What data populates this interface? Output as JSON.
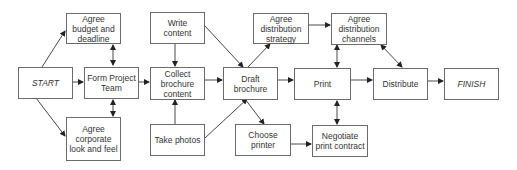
{
  "diagram": {
    "type": "flowchart",
    "nodes": {
      "start": "START",
      "budget": "Agree budget and deadline",
      "corporate": "Agree corporate look and feel",
      "team": "Form Project Team",
      "write": "Write content",
      "collect": "Collect brochure content",
      "photos": "Take photos",
      "draft": "Draft brochure",
      "strategy": "Agree distribution strategy",
      "printer": "Choose printer",
      "print": "Print",
      "channels": "Agree distribution channels",
      "contract": "Negotiate print contract",
      "distribute": "Distribute",
      "finish": "FINISH"
    },
    "edges": [
      {
        "from": "START",
        "to": "Agree budget and deadline"
      },
      {
        "from": "START",
        "to": "Form Project Team"
      },
      {
        "from": "START",
        "to": "Agree corporate look and feel"
      },
      {
        "from": "Agree budget and deadline",
        "to": "Form Project Team",
        "bidirectional": true
      },
      {
        "from": "Agree corporate look and feel",
        "to": "Form Project Team",
        "bidirectional": true
      },
      {
        "from": "Form Project Team",
        "to": "Collect brochure content"
      },
      {
        "from": "Write content",
        "to": "Collect brochure content"
      },
      {
        "from": "Take photos",
        "to": "Collect brochure content"
      },
      {
        "from": "Write content",
        "to": "Draft brochure"
      },
      {
        "from": "Take photos",
        "to": "Draft brochure"
      },
      {
        "from": "Collect brochure content",
        "to": "Draft brochure"
      },
      {
        "from": "Draft brochure",
        "to": "Agree distribution strategy"
      },
      {
        "from": "Draft brochure",
        "to": "Choose printer"
      },
      {
        "from": "Draft brochure",
        "to": "Print"
      },
      {
        "from": "Agree distribution strategy",
        "to": "Agree distribution channels"
      },
      {
        "from": "Choose printer",
        "to": "Negotiate print contract"
      },
      {
        "from": "Negotiate print contract",
        "to": "Print",
        "bidirectional": true
      },
      {
        "from": "Agree distribution channels",
        "to": "Print",
        "bidirectional": true
      },
      {
        "from": "Agree distribution channels",
        "to": "Distribute",
        "bidirectional": true
      },
      {
        "from": "Print",
        "to": "Distribute"
      },
      {
        "from": "Distribute",
        "to": "FINISH"
      }
    ]
  }
}
